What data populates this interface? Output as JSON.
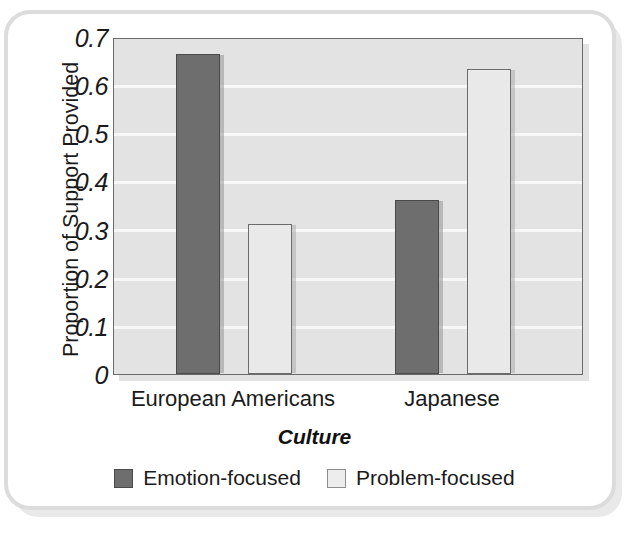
{
  "chart_data": {
    "type": "bar",
    "title": "",
    "xlabel": "Culture",
    "ylabel": "Proportion of Support Provided",
    "categories": [
      "European Americans",
      "Japanese"
    ],
    "series": [
      {
        "name": "Emotion-focused",
        "color": "#6e6e6e",
        "values": [
          0.67,
          0.365
        ]
      },
      {
        "name": "Problem-focused",
        "color": "#e9e9e9",
        "values": [
          0.315,
          0.64
        ]
      }
    ],
    "ylim": [
      0,
      0.7
    ],
    "ytick_labels": [
      "0.7",
      "0.6",
      "0.5",
      "0.4",
      "0.3",
      "0.2",
      "0.1",
      "0"
    ],
    "ytick_values": [
      0.7,
      0.6,
      0.5,
      0.4,
      0.3,
      0.2,
      0.1,
      0
    ],
    "grid": "horizontal",
    "legend_position": "bottom-center"
  },
  "legend": {
    "items": [
      {
        "label": "Emotion-focused",
        "swatch": "dark"
      },
      {
        "label": "Problem-focused",
        "swatch": "light"
      }
    ]
  }
}
